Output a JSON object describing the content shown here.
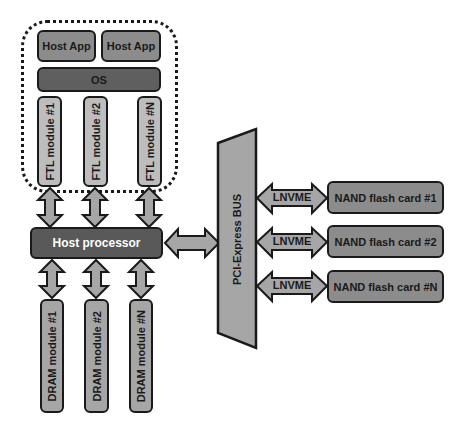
{
  "diagram": {
    "host_container": {
      "host_apps": [
        {
          "label": "Host App"
        },
        {
          "label": "Host App"
        }
      ],
      "os": {
        "label": "OS"
      },
      "ftl_modules": [
        {
          "label": "FTL module #1"
        },
        {
          "label": "FTL module #2"
        },
        {
          "label": "FTL module #N"
        }
      ]
    },
    "host_processor": {
      "label": "Host processor"
    },
    "dram_modules": [
      {
        "label": "DRAM module #1"
      },
      {
        "label": "DRAM module #2"
      },
      {
        "label": "DRAM module #N"
      }
    ],
    "bus": {
      "label": "PCI-Express BUS"
    },
    "links": [
      {
        "label": "LNVME"
      },
      {
        "label": "LNVME"
      },
      {
        "label": "LNVME"
      }
    ],
    "nand_cards": [
      {
        "label": "NAND flash card #1"
      },
      {
        "label": "NAND flash card #2"
      },
      {
        "label": "NAND flash card #N"
      }
    ],
    "colors": {
      "light_gray": "#a6a6a6",
      "mid_gray": "#8c8c8c",
      "dark_gray": "#595959",
      "outline": "#1a1a1a"
    }
  }
}
